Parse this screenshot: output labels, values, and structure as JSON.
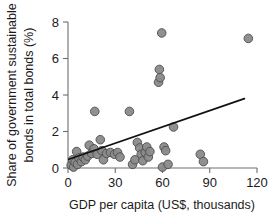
{
  "chart_data": {
    "type": "scatter",
    "title": "",
    "xlabel": "GDP per capita (US$, thousands)",
    "ylabel": "Share of government sustainable bonds in total bonds (%)",
    "xlim": [
      0,
      120
    ],
    "ylim": [
      0,
      8
    ],
    "xticks": [
      0,
      30,
      60,
      90,
      120
    ],
    "yticks": [
      0,
      2,
      4,
      6,
      8
    ],
    "xtick_labels": [
      "0",
      "30",
      "60",
      "90",
      "120"
    ],
    "ytick_labels": [
      "0",
      "2",
      "4",
      "6",
      "8"
    ],
    "grid": false,
    "legend": null,
    "marker_color": "#8a8a8a",
    "marker_edge_color": "#4d4d4d",
    "trendline_color": "#111111",
    "axis_color": "#6e6e6e",
    "background_color": "#ffffff",
    "points": [
      {
        "x": 2.0,
        "y": 0.15
      },
      {
        "x": 3.0,
        "y": 0.45
      },
      {
        "x": 3.5,
        "y": 0.05
      },
      {
        "x": 4.5,
        "y": 0.3
      },
      {
        "x": 5.5,
        "y": 0.9
      },
      {
        "x": 6.0,
        "y": 0.2
      },
      {
        "x": 7.0,
        "y": 0.55
      },
      {
        "x": 8.5,
        "y": 0.35
      },
      {
        "x": 9.5,
        "y": 0.6
      },
      {
        "x": 11.0,
        "y": 0.45
      },
      {
        "x": 12.5,
        "y": 0.65
      },
      {
        "x": 13.5,
        "y": 1.25
      },
      {
        "x": 15.0,
        "y": 0.8
      },
      {
        "x": 16.5,
        "y": 1.05
      },
      {
        "x": 17.0,
        "y": 3.1
      },
      {
        "x": 18.5,
        "y": 0.75
      },
      {
        "x": 20.5,
        "y": 1.55
      },
      {
        "x": 21.5,
        "y": 0.95
      },
      {
        "x": 22.5,
        "y": 0.45
      },
      {
        "x": 24.5,
        "y": 0.8
      },
      {
        "x": 27.0,
        "y": 0.85
      },
      {
        "x": 29.5,
        "y": 0.75
      },
      {
        "x": 31.5,
        "y": 0.85
      },
      {
        "x": 33.0,
        "y": 0.6
      },
      {
        "x": 39.0,
        "y": 3.1
      },
      {
        "x": 41.0,
        "y": 0.2
      },
      {
        "x": 42.5,
        "y": 0.45
      },
      {
        "x": 44.0,
        "y": 1.4
      },
      {
        "x": 45.5,
        "y": 1.1
      },
      {
        "x": 46.5,
        "y": 0.75
      },
      {
        "x": 47.5,
        "y": 0.4
      },
      {
        "x": 49.0,
        "y": 0.85
      },
      {
        "x": 50.0,
        "y": 1.15
      },
      {
        "x": 51.0,
        "y": 0.6
      },
      {
        "x": 52.0,
        "y": 0.9
      },
      {
        "x": 57.5,
        "y": 4.7
      },
      {
        "x": 58.0,
        "y": 5.4
      },
      {
        "x": 58.5,
        "y": 4.95
      },
      {
        "x": 59.5,
        "y": 7.4
      },
      {
        "x": 60.0,
        "y": 0.05
      },
      {
        "x": 61.0,
        "y": 1.15
      },
      {
        "x": 62.0,
        "y": 0.95
      },
      {
        "x": 63.5,
        "y": 0.2
      },
      {
        "x": 67.0,
        "y": 2.25
      },
      {
        "x": 84.0,
        "y": 0.75
      },
      {
        "x": 86.0,
        "y": 0.35
      },
      {
        "x": 114.5,
        "y": 7.1
      }
    ],
    "trendline": {
      "x_start": 0.5,
      "y_start": 0.48,
      "x_end": 112.0,
      "y_end": 3.8
    }
  }
}
